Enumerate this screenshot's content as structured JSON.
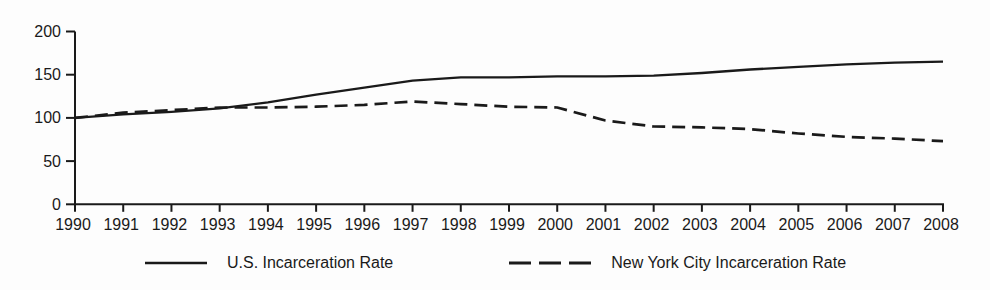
{
  "chart_data": {
    "type": "line",
    "title": "",
    "xlabel": "",
    "ylabel": "",
    "grid": false,
    "legend_position": "bottom",
    "background_color": "#fdfdfd",
    "line_color": "#1a1a1a",
    "ylim": [
      0,
      200
    ],
    "yticks": [
      0,
      50,
      100,
      150,
      200
    ],
    "categories": [
      "1990",
      "1991",
      "1992",
      "1993",
      "1994",
      "1995",
      "1996",
      "1997",
      "1998",
      "1999",
      "2000",
      "2001",
      "2002",
      "2003",
      "2004",
      "2005",
      "2006",
      "2007",
      "2008"
    ],
    "series": [
      {
        "name": "U.S. Incarceration Rate",
        "style": "solid",
        "values": [
          100,
          104,
          107,
          111,
          118,
          127,
          135,
          143,
          147,
          147,
          148,
          148,
          149,
          152,
          156,
          159,
          162,
          164,
          165
        ]
      },
      {
        "name": "New York City Incarceration Rate",
        "style": "dashed",
        "values": [
          100,
          106,
          109,
          112,
          112,
          113,
          115,
          119,
          116,
          113,
          112,
          97,
          90,
          89,
          87,
          82,
          78,
          76,
          73
        ]
      }
    ]
  }
}
